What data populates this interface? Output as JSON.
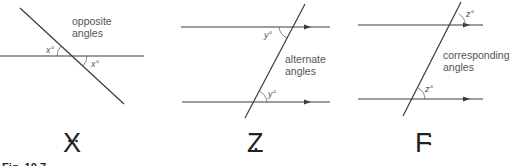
{
  "figure": {
    "caption": "Fig. 10.7",
    "line_color": "#3a3a3a",
    "text_color": "#555555"
  },
  "diagrams": [
    {
      "id": "X",
      "letter": "X",
      "description_line1": "opposite",
      "description_line2": "angles",
      "angle_label_1": "x°",
      "angle_label_2": "x°"
    },
    {
      "id": "Z",
      "letter": "Z",
      "description_line1": "alternate",
      "description_line2": "angles",
      "angle_label_1": "y°",
      "angle_label_2": "y°"
    },
    {
      "id": "F",
      "letter": "F",
      "description_line1": "corresponding",
      "description_line2": "angles",
      "angle_label_1": "z°",
      "angle_label_2": "z°"
    }
  ]
}
